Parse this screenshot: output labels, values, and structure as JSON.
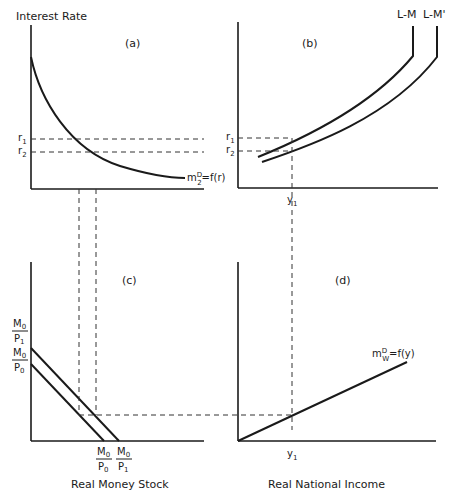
{
  "diagram": {
    "panels": [
      {
        "id": "a",
        "label": "(a)",
        "y_axis_label": "Interest Rate",
        "curve_label": {
          "base": "m",
          "sup": "D",
          "sub": "2",
          "rest": "=f(r)"
        },
        "ticks_y": [
          "r",
          "r"
        ],
        "ticks_y_sub": [
          "1",
          "2"
        ]
      },
      {
        "id": "b",
        "label": "(b)",
        "curve_labels": [
          "L-M",
          "L-M'"
        ],
        "ticks_y": [
          "r",
          "r"
        ],
        "ticks_y_sub": [
          "1",
          "2"
        ],
        "tick_x": "y",
        "tick_x_sub": "1"
      },
      {
        "id": "c",
        "label": "(c)",
        "x_axis_label": "Real Money Stock",
        "y_ticks": [
          {
            "num": "M",
            "num_sub": "0",
            "den": "P",
            "den_sub": "1"
          },
          {
            "num": "M",
            "num_sub": "0",
            "den": "P",
            "den_sub": "0"
          }
        ],
        "x_ticks": [
          {
            "num": "M",
            "num_sub": "0",
            "den": "P",
            "den_sub": "0"
          },
          {
            "num": "M",
            "num_sub": "0",
            "den": "P",
            "den_sub": "1"
          }
        ]
      },
      {
        "id": "d",
        "label": "(d)",
        "x_axis_label": "Real National Income",
        "curve_label": {
          "base": "m",
          "sup": "D",
          "sub": "W",
          "rest": "=f(y)"
        },
        "tick_x": "y",
        "tick_x_sub": "1"
      }
    ]
  }
}
